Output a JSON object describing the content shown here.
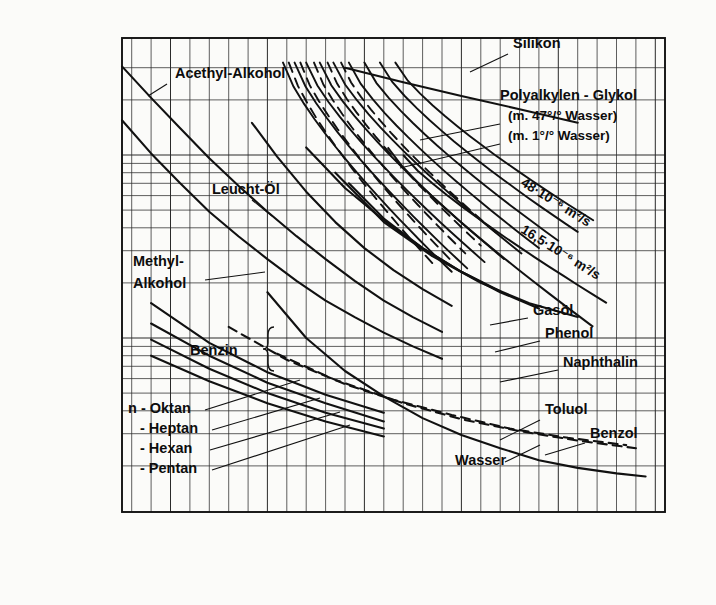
{
  "figure": {
    "kind": "engineering-nomograph",
    "background": "#fbfbf9",
    "ink": "#111111"
  },
  "axes": {
    "y_title": "kinematische Viskosität",
    "y_symbol": "ν",
    "y_arrow": "↑",
    "x_title": "Temperatur",
    "x_symbol": "t",
    "x_arrow": "→",
    "x_unit": "°C",
    "y_tick_labels": [
      "10",
      "10",
      "10"
    ],
    "y_tick_exponents": [
      "-5",
      "-6",
      "-7"
    ],
    "y_tick_values": [
      1e-05,
      1e-06,
      1e-07
    ],
    "x_tick_labels": [
      "-50",
      "0",
      "50",
      "100",
      "150",
      "200"
    ],
    "x_tick_values": [
      -50,
      0,
      50,
      100,
      150,
      200
    ],
    "x_minor_step": 10,
    "grid": "log-y linear-x"
  },
  "chart_data": {
    "type": "line",
    "title": "",
    "xlabel": "Temperatur t",
    "ylabel": "kinematische Viskosität ν",
    "xlim": [
      -75,
      205
    ],
    "ylim": [
      1e-07,
      3.2e-05
    ],
    "yscale": "log",
    "xunit": "°C",
    "yunit": "m²/s",
    "grid": true,
    "legend": "inline-labels",
    "series": [
      {
        "name": "Acethyl-Alkohol",
        "style": "solid",
        "label_pos": [
          175,
          78
        ],
        "leader": [
          [
            167,
            84
          ],
          [
            148,
            96
          ]
        ],
        "points": [
          [
            -75,
            3.05e-05
          ],
          [
            -60,
            2.05e-05
          ],
          [
            -45,
            1.4e-05
          ],
          [
            -30,
            9.6e-06
          ],
          [
            -15,
            6.8e-06
          ],
          [
            0,
            4.9e-06
          ],
          [
            15,
            3.6e-06
          ],
          [
            30,
            2.7e-06
          ],
          [
            45,
            2.05e-06
          ],
          [
            60,
            1.6e-06
          ],
          [
            75,
            1.3e-06
          ],
          [
            90,
            1.08e-06
          ]
        ]
      },
      {
        "name": "Methyl-Alkohol",
        "style": "solid",
        "label_pos": [
          133,
          266
        ],
        "label_pos2": [
          133,
          288
        ],
        "leader": [
          [
            205,
            280
          ],
          [
            265,
            272
          ]
        ],
        "points": [
          [
            -75,
            1.55e-05
          ],
          [
            -60,
            1.02e-05
          ],
          [
            -45,
            7e-06
          ],
          [
            -30,
            4.9e-06
          ],
          [
            -15,
            3.6e-06
          ],
          [
            0,
            2.7e-06
          ],
          [
            15,
            2.05e-06
          ],
          [
            30,
            1.6e-06
          ],
          [
            45,
            1.3e-06
          ],
          [
            60,
            1.07e-06
          ],
          [
            75,
            9e-07
          ],
          [
            90,
            7.7e-07
          ]
        ]
      },
      {
        "name": "Leucht-Öl",
        "style": "solid",
        "label_pos": [
          212,
          194
        ],
        "leader": [
          [
            252,
            200
          ],
          [
            272,
            216
          ]
        ],
        "points": [
          [
            -8,
            1.5e-05
          ],
          [
            5,
            9.8e-06
          ],
          [
            20,
            6.3e-06
          ],
          [
            35,
            4.3e-06
          ],
          [
            50,
            3.1e-06
          ],
          [
            65,
            2.35e-06
          ],
          [
            80,
            1.85e-06
          ],
          [
            95,
            1.5e-06
          ]
        ]
      },
      {
        "name": "Silikon",
        "style": "solid",
        "label_pos": [
          513,
          48
        ],
        "leader": [
          [
            508,
            54
          ],
          [
            470,
            72
          ]
        ],
        "points": [
          [
            40,
            3e-05
          ],
          [
            70,
            2.5e-05
          ],
          [
            100,
            2.1e-05
          ],
          [
            130,
            1.78e-05
          ],
          [
            160,
            1.5e-05
          ]
        ]
      },
      {
        "name": "Polyalkylen - Glykol",
        "style": "solid",
        "label_pos": [
          500,
          100
        ],
        "note1": "(m.  47°/° Wasser)",
        "note2": "(m.   1°/° Wasser)",
        "note1_pos": [
          508,
          120
        ],
        "note2_pos": [
          508,
          140
        ],
        "leader1": [
          [
            500,
            124
          ],
          [
            420,
            140
          ]
        ],
        "leader2": [
          [
            500,
            144
          ],
          [
            400,
            168
          ]
        ]
      },
      {
        "name": "48·10⁻⁶ m²/s",
        "style": "solid",
        "rotated": true,
        "label_pos": [
          520,
          185
        ],
        "angle": 32
      },
      {
        "name": "16,5·10⁻⁶ m²/s",
        "style": "solid",
        "rotated": true,
        "label_pos": [
          520,
          232
        ],
        "angle": 32
      },
      {
        "name": "Gasöl",
        "style": "solid",
        "label_pos": [
          533,
          315
        ],
        "leader": [
          [
            528,
            318
          ],
          [
            490,
            325
          ]
        ],
        "points": [
          [
            20,
            1.1e-05
          ],
          [
            40,
            6.6e-06
          ],
          [
            60,
            4.4e-06
          ],
          [
            80,
            3.1e-06
          ],
          [
            100,
            2.3e-06
          ],
          [
            120,
            1.8e-06
          ]
        ]
      },
      {
        "name": "Phenol",
        "style": "solid",
        "label_pos": [
          545,
          338
        ],
        "leader": [
          [
            540,
            341
          ],
          [
            495,
            352
          ]
        ],
        "points": [
          [
            42,
            7e-06
          ],
          [
            60,
            4.5e-06
          ],
          [
            80,
            3.1e-06
          ],
          [
            100,
            2.3e-06
          ],
          [
            120,
            1.78e-06
          ],
          [
            140,
            1.45e-06
          ]
        ]
      },
      {
        "name": "Naphthalin",
        "style": "solid",
        "label_pos": [
          563,
          367
        ],
        "leader": [
          [
            558,
            370
          ],
          [
            500,
            382
          ]
        ],
        "points": [
          [
            35,
            8e-06
          ],
          [
            60,
            4.3e-06
          ],
          [
            85,
            2.8e-06
          ],
          [
            110,
            2e-06
          ],
          [
            135,
            1.55e-06
          ],
          [
            160,
            1.3e-06
          ]
        ]
      },
      {
        "name": "Toluol",
        "style": "dashed",
        "label_pos": [
          545,
          414
        ],
        "leader": [
          [
            540,
            420
          ],
          [
            500,
            440
          ]
        ],
        "points": [
          [
            -20,
            1.15e-06
          ],
          [
            10,
            7.6e-07
          ],
          [
            40,
            5.6e-07
          ],
          [
            70,
            4.4e-07
          ],
          [
            100,
            3.6e-07
          ],
          [
            130,
            3.1e-07
          ],
          [
            160,
            2.75e-07
          ],
          [
            190,
            2.5e-07
          ]
        ]
      },
      {
        "name": "Benzol",
        "style": "dashed",
        "label_pos": [
          590,
          438
        ],
        "leader": [
          [
            585,
            443
          ],
          [
            545,
            455
          ]
        ],
        "points": [
          [
            5,
            8.2e-07
          ],
          [
            35,
            5.9e-07
          ],
          [
            65,
            4.6e-07
          ],
          [
            95,
            3.8e-07
          ],
          [
            125,
            3.2e-07
          ],
          [
            155,
            2.85e-07
          ],
          [
            185,
            2.6e-07
          ]
        ]
      },
      {
        "name": "Wasser",
        "style": "solid",
        "label_pos": [
          455,
          465
        ],
        "leader": [
          [
            505,
            462
          ],
          [
            540,
            445
          ]
        ],
        "points": [
          [
            0,
            1.78e-06
          ],
          [
            20,
            1e-06
          ],
          [
            40,
            6.6e-07
          ],
          [
            60,
            4.8e-07
          ],
          [
            80,
            3.65e-07
          ],
          [
            100,
            2.95e-07
          ],
          [
            120,
            2.5e-07
          ],
          [
            140,
            2.15e-07
          ],
          [
            160,
            1.95e-07
          ],
          [
            180,
            1.82e-07
          ],
          [
            195,
            1.75e-07
          ]
        ]
      },
      {
        "name": "Benzin",
        "style": "bracket-group",
        "label_pos": [
          190,
          355
        ],
        "bracket_pos": [
          268,
          355
        ]
      },
      {
        "name": "n - Oktan",
        "style": "solid",
        "label_pos": [
          128,
          413
        ],
        "leader": [
          [
            205,
            410
          ],
          [
            300,
            380
          ]
        ],
        "points": [
          [
            -60,
            1.55e-06
          ],
          [
            -30,
            9.4e-07
          ],
          [
            0,
            6.5e-07
          ],
          [
            30,
            4.9e-07
          ],
          [
            60,
            3.9e-07
          ]
        ]
      },
      {
        "name": "- Heptan",
        "style": "solid",
        "label_pos": [
          140,
          433
        ],
        "leader": [
          [
            212,
            430
          ],
          [
            320,
            398
          ]
        ],
        "points": [
          [
            -60,
            1.2e-06
          ],
          [
            -30,
            8e-07
          ],
          [
            0,
            5.7e-07
          ],
          [
            30,
            4.4e-07
          ],
          [
            60,
            3.5e-07
          ]
        ]
      },
      {
        "name": "- Hexan",
        "style": "solid",
        "label_pos": [
          140,
          453
        ],
        "leader": [
          [
            210,
            450
          ],
          [
            340,
            412
          ]
        ],
        "points": [
          [
            -60,
            9.8e-07
          ],
          [
            -30,
            6.8e-07
          ],
          [
            0,
            5e-07
          ],
          [
            30,
            3.9e-07
          ],
          [
            60,
            3.2e-07
          ]
        ]
      },
      {
        "name": "- Pentan",
        "style": "solid",
        "label_pos": [
          140,
          473
        ],
        "leader": [
          [
            212,
            470
          ],
          [
            350,
            425
          ]
        ],
        "points": [
          [
            -60,
            8e-07
          ],
          [
            -30,
            5.8e-07
          ],
          [
            0,
            4.4e-07
          ],
          [
            30,
            3.5e-07
          ],
          [
            60,
            2.9e-07
          ]
        ]
      }
    ],
    "oil_bundle": {
      "description": "dense bundle of mineral-oil curves (solid and dashed) in upper centre",
      "count": 14,
      "x_range": [
        10,
        120
      ],
      "y_range": [
        3.2e-05,
        2e-06
      ]
    }
  }
}
